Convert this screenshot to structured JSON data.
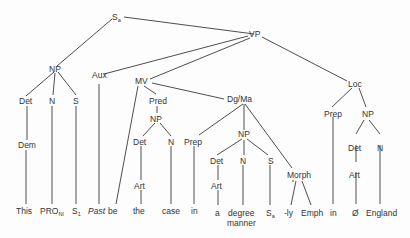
{
  "diagram": {
    "type": "syntax-tree",
    "nodes": {
      "root": {
        "label": "S",
        "sub": "a"
      },
      "vp": {
        "label": "VP"
      },
      "np_subj": {
        "label": "NP"
      },
      "np_det": {
        "label": "Det"
      },
      "np_n": {
        "label": "N"
      },
      "np_s": {
        "label": "S"
      },
      "np_dem": {
        "label": "Dem"
      },
      "aux": {
        "label": "Aux"
      },
      "mv": {
        "label": "MV"
      },
      "pred": {
        "label": "Pred"
      },
      "pred_np": {
        "label": "NP"
      },
      "pred_det": {
        "label": "Det"
      },
      "pred_n": {
        "label": "N"
      },
      "pred_art": {
        "label": "Art"
      },
      "dgma": {
        "label": "Dg/Ma"
      },
      "dg_prep": {
        "label": "Prep"
      },
      "dg_np": {
        "label": "NP"
      },
      "dg_det": {
        "label": "Det"
      },
      "dg_n": {
        "label": "N"
      },
      "dg_s": {
        "label": "S"
      },
      "dg_art": {
        "label": "Art"
      },
      "morph": {
        "label": "Morph"
      },
      "loc": {
        "label": "Loc"
      },
      "loc_prep": {
        "label": "Prep"
      },
      "loc_np": {
        "label": "NP"
      },
      "loc_det": {
        "label": "Det"
      },
      "loc_n": {
        "label": "N"
      },
      "loc_art": {
        "label": "Art"
      }
    },
    "leaves": {
      "this": "This",
      "pro": "PRO",
      "pro_sub": "Nl",
      "s1": "S",
      "s1_sub": "1",
      "past": "Past",
      "be": "be",
      "the": "the",
      "case": "case",
      "in1": "in",
      "a": "a",
      "degree": "degree",
      "manner": "manner",
      "sa": "S",
      "sa_sub": "a",
      "ly": "-ly",
      "emph": "Emph",
      "in2": "in",
      "null": "Ø",
      "england": "England"
    }
  }
}
